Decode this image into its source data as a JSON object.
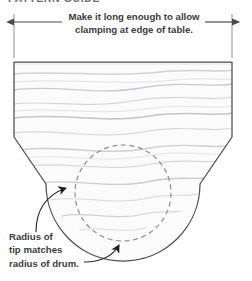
{
  "figure": {
    "name": "board-tip-detail-drawing",
    "title_partial": "PATTERN GUIDE",
    "background_color": "#ffffff"
  },
  "dimension": {
    "name": "overall-length-dimension",
    "note_line_1": "Make it long enough to allow",
    "note_line_2": "clamping at edge of table.",
    "arrow_color": "#4a4a4a",
    "extension_line_color": "#9a9a9a",
    "left_x": 14,
    "right_x": 232,
    "line_y": 22
  },
  "board": {
    "name": "wooden-board-blank",
    "outline_color": "#4d4d4d",
    "fill_color": "#fbfbfb",
    "grain_color": "#c9ccd1",
    "top_y": 62,
    "left_x": 14,
    "right_x": 232,
    "chamfer_start_y": 137,
    "tip_bottom_y": 241
  },
  "drum": {
    "name": "drum-radius-circle",
    "style": "dashed",
    "color": "#8f8f8f",
    "center_x": 123,
    "center_y": 193,
    "radius": 48
  },
  "callout": {
    "name": "tip-radius-callout",
    "line_1": "Radius of",
    "line_2": "tip matches",
    "line_3": "radius of drum.",
    "leader_color": "#2b2b2b",
    "arrow_1_target_x": 70,
    "arrow_1_target_y": 186,
    "arrow_2_target_x": 120,
    "arrow_2_target_y": 241
  }
}
